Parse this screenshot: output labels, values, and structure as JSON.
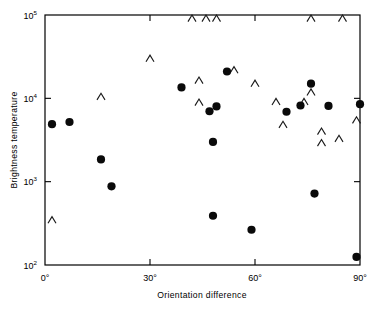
{
  "chart_data": {
    "type": "scatter",
    "title": "",
    "xlabel": "Orientation difference",
    "ylabel": "Brightness temperature",
    "xlim": [
      0,
      90
    ],
    "ylim": [
      100,
      100000
    ],
    "yscale": "log",
    "xscale": "linear",
    "grid": false,
    "legend": null,
    "xticks": [
      0,
      30,
      60,
      90
    ],
    "xticklabels": [
      "0°",
      "30°",
      "60°",
      "90°"
    ],
    "yticks": [
      100,
      1000,
      10000,
      100000
    ],
    "yticklabels": [
      "10²",
      "10³",
      "10⁴",
      "10⁵"
    ],
    "ytick_bases": [
      "10",
      "10",
      "10",
      "10"
    ],
    "ytick_exponents": [
      "2",
      "3",
      "4",
      "5"
    ],
    "series": [
      {
        "name": "measurements",
        "marker": "filled-circle",
        "color": "#0a0a0a",
        "points": [
          {
            "x": 2,
            "y": 4900
          },
          {
            "x": 7,
            "y": 5200
          },
          {
            "x": 16,
            "y": 1850
          },
          {
            "x": 19,
            "y": 880
          },
          {
            "x": 39,
            "y": 13500
          },
          {
            "x": 47,
            "y": 7000
          },
          {
            "x": 49,
            "y": 8000
          },
          {
            "x": 48,
            "y": 3000
          },
          {
            "x": 52,
            "y": 21000
          },
          {
            "x": 48,
            "y": 390
          },
          {
            "x": 59,
            "y": 265
          },
          {
            "x": 69,
            "y": 6900
          },
          {
            "x": 76,
            "y": 15000
          },
          {
            "x": 73,
            "y": 8200
          },
          {
            "x": 77,
            "y": 720
          },
          {
            "x": 81,
            "y": 8100
          },
          {
            "x": 90,
            "y": 8500
          },
          {
            "x": 89,
            "y": 125
          }
        ]
      },
      {
        "name": "upper-limits",
        "marker": "caret-up",
        "color": "#1a1a1a",
        "points": [
          {
            "x": 2,
            "y": 380
          },
          {
            "x": 16,
            "y": 11500
          },
          {
            "x": 30,
            "y": 33000
          },
          {
            "x": 42,
            "y": 100000
          },
          {
            "x": 46,
            "y": 100000
          },
          {
            "x": 49,
            "y": 100000
          },
          {
            "x": 44,
            "y": 18000
          },
          {
            "x": 44,
            "y": 9800
          },
          {
            "x": 54,
            "y": 24000
          },
          {
            "x": 60,
            "y": 16500
          },
          {
            "x": 66,
            "y": 10000
          },
          {
            "x": 68,
            "y": 5300
          },
          {
            "x": 74,
            "y": 10000
          },
          {
            "x": 76,
            "y": 13000
          },
          {
            "x": 76,
            "y": 100000
          },
          {
            "x": 79,
            "y": 4400
          },
          {
            "x": 79,
            "y": 3200
          },
          {
            "x": 84,
            "y": 3600
          },
          {
            "x": 85,
            "y": 100000
          },
          {
            "x": 89,
            "y": 6000
          }
        ]
      }
    ]
  },
  "axes": {
    "x_label": "Orientation difference",
    "y_label": "Brightness temperature"
  }
}
